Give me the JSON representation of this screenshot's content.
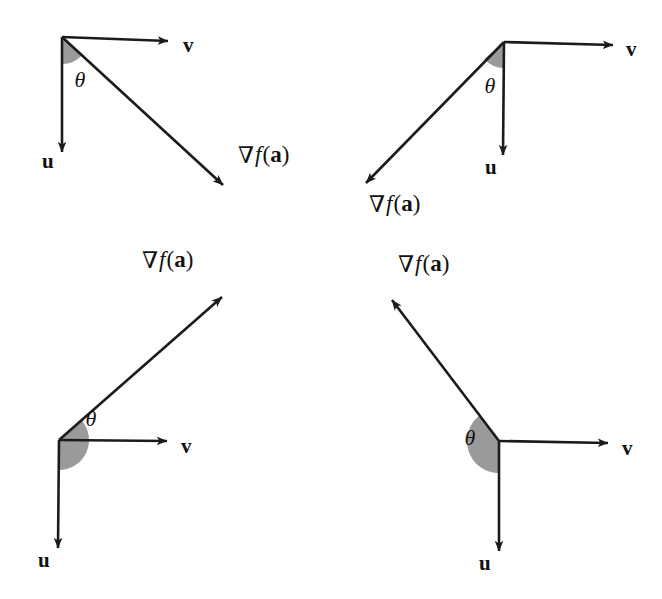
{
  "figure": {
    "background_color": "#ffffff",
    "stroke_color": "#1b1b1b",
    "wedge_color": "#9a9a9a",
    "width": 662,
    "height": 599
  },
  "labels": {
    "u": "u",
    "v": "v",
    "theta": "θ",
    "nabla": "∇",
    "f": "f",
    "open_paren": "(",
    "a": "a",
    "close_paren": ")",
    "gradient_full": "∇f(a)"
  },
  "chart_data": {
    "type": "diagram",
    "panels": [
      {
        "id": "panel-top-left",
        "position": "top-left",
        "origin": [
          62,
          37
        ],
        "vectors": [
          {
            "name": "v",
            "tip": [
              168,
              41
            ],
            "label": "v",
            "label_pos": [
              183,
              47
            ],
            "angle_deg": 2
          },
          {
            "name": "u",
            "tip": [
              62,
              152
            ],
            "label": "u",
            "label_pos": [
              42,
              163
            ],
            "angle_deg": 90
          },
          {
            "name": "gradient",
            "tip": [
              223,
              185
            ],
            "label": "∇f(a)",
            "label_pos": [
              238,
              157
            ],
            "angle_deg": 41
          }
        ],
        "theta": {
          "label": "θ",
          "label_pos": [
            80,
            82
          ],
          "wedge_start_deg": 90,
          "wedge_end_deg": 41,
          "wedge_radius": 27,
          "shaded": true
        },
        "theta_between": [
          "u",
          "gradient"
        ],
        "theta_magnitude_deg": 49,
        "theta_class": "acute"
      },
      {
        "id": "panel-top-right",
        "position": "top-right",
        "origin": [
          504,
          42
        ],
        "vectors": [
          {
            "name": "v",
            "tip": [
              613,
              45
            ],
            "label": "v",
            "label_pos": [
              626,
              51
            ],
            "angle_deg": 2
          },
          {
            "name": "u",
            "tip": [
              503,
              155
            ],
            "label": "u",
            "label_pos": [
              485,
              169
            ],
            "angle_deg": 90
          },
          {
            "name": "gradient",
            "tip": [
              366,
              183
            ],
            "label": "∇f(a)",
            "label_pos": [
              369,
              206
            ],
            "angle_deg": 139
          },
          {
            "name": "v-extension-dotted",
            "tip": [
              504,
              42
            ],
            "label": "",
            "label_pos": [
              0,
              0
            ],
            "angle_deg": 0
          }
        ],
        "theta": {
          "label": "θ",
          "label_pos": [
            490,
            88
          ],
          "wedge_start_deg": 90,
          "wedge_end_deg": 139,
          "wedge_radius": 26,
          "shaded": true
        },
        "theta_between": [
          "u",
          "gradient"
        ],
        "theta_magnitude_deg": 49,
        "theta_class": "acute"
      },
      {
        "id": "panel-bottom-left",
        "position": "bottom-left",
        "origin": [
          59,
          440
        ],
        "vectors": [
          {
            "name": "v",
            "tip": [
              167,
              441
            ],
            "label": "v",
            "label_pos": [
              181,
              448
            ],
            "angle_deg": 1
          },
          {
            "name": "u",
            "tip": [
              58,
              548
            ],
            "label": "u",
            "label_pos": [
              38,
              562
            ],
            "angle_deg": 90
          },
          {
            "name": "gradient",
            "tip": [
              222,
              297
            ],
            "label": "∇f(a)",
            "label_pos": [
              142,
              262
            ],
            "angle_deg": -41
          }
        ],
        "theta": {
          "label": "θ",
          "label_pos": [
            91,
            421
          ],
          "wedge_start_deg": 90,
          "wedge_end_deg": -41,
          "wedge_radius": 30,
          "shaded": true
        },
        "theta_between": [
          "u",
          "gradient"
        ],
        "theta_magnitude_deg": 131,
        "theta_class": "obtuse"
      },
      {
        "id": "panel-bottom-right",
        "position": "bottom-right",
        "origin": [
          499,
          441
        ],
        "vectors": [
          {
            "name": "v",
            "tip": [
              608,
              443
            ],
            "label": "v",
            "label_pos": [
              622,
              450
            ],
            "angle_deg": 1
          },
          {
            "name": "u",
            "tip": [
              499,
              551
            ],
            "label": "u",
            "label_pos": [
              479,
              565
            ],
            "angle_deg": 90
          },
          {
            "name": "gradient",
            "tip": [
              392,
              300
            ],
            "label": "∇f(a)",
            "label_pos": [
              398,
              266
            ],
            "angle_deg": -126
          }
        ],
        "theta": {
          "label": "θ",
          "label_pos": [
            470,
            440
          ],
          "wedge_start_deg": 90,
          "wedge_end_deg": 234,
          "wedge_radius": 32,
          "shaded": true
        },
        "theta_between": [
          "u",
          "gradient"
        ],
        "theta_magnitude_deg": 144,
        "theta_class": "obtuse"
      }
    ]
  }
}
